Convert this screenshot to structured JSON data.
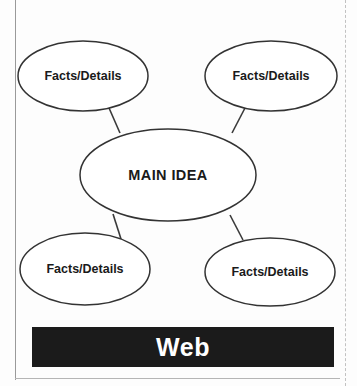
{
  "worksheet": {
    "organizer_type": "Web",
    "title_bar": {
      "label": "Web",
      "background_color": "#1b1b1b",
      "text_color": "#ffffff"
    },
    "frame": {
      "border_color": "#9a9a9a",
      "dotted_edge_color": "#c2c2c2"
    }
  },
  "diagram": {
    "background_color": "#fdfdfd",
    "node_fill": "#ffffff",
    "node_stroke": "#333333",
    "connector_color": "#3a3a3a",
    "center_node": {
      "id": "main-idea",
      "label": "MAIN IDEA",
      "cx": 168,
      "cy": 175,
      "rx": 88,
      "ry": 46
    },
    "outer_nodes": [
      {
        "id": "facts-details-top-left",
        "label": "Facts/Details",
        "position": "top-left",
        "cx": 83,
        "cy": 76,
        "rx": 65,
        "ry": 35
      },
      {
        "id": "facts-details-top-right",
        "label": "Facts/Details",
        "position": "top-right",
        "cx": 271,
        "cy": 76,
        "rx": 66,
        "ry": 35
      },
      {
        "id": "facts-details-bottom-left",
        "label": "Facts/Details",
        "position": "bottom-left",
        "cx": 85,
        "cy": 269,
        "rx": 65,
        "ry": 36
      },
      {
        "id": "facts-details-bottom-right",
        "label": "Facts/Details",
        "position": "bottom-right",
        "cx": 270,
        "cy": 272,
        "rx": 65,
        "ry": 34
      }
    ],
    "connectors": [
      {
        "id": "connector-top-left",
        "from": "facts-details-top-left",
        "to": "main-idea",
        "x1": 109,
        "y1": 108,
        "x2": 120,
        "y2": 133
      },
      {
        "id": "connector-top-right",
        "from": "facts-details-top-right",
        "to": "main-idea",
        "x1": 245,
        "y1": 108,
        "x2": 232,
        "y2": 133
      },
      {
        "id": "connector-bottom-left",
        "from": "main-idea",
        "to": "facts-details-bottom-left",
        "x1": 113,
        "y1": 214,
        "x2": 121,
        "y2": 239
      },
      {
        "id": "connector-bottom-right",
        "from": "main-idea",
        "to": "facts-details-bottom-right",
        "x1": 230,
        "y1": 215,
        "x2": 243,
        "y2": 240
      }
    ]
  }
}
